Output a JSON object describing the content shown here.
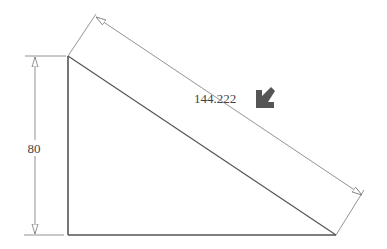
{
  "drawing": {
    "shape": "right-triangle",
    "vertices": {
      "top": [
        68,
        56
      ],
      "bottom_left": [
        68,
        235
      ],
      "bottom_right": [
        336,
        235
      ]
    },
    "colors": {
      "outline": "#555555",
      "dimension": "#777777",
      "text": "#444444",
      "pointer_arrow": "#555555"
    }
  },
  "dimensions": {
    "vertical": {
      "value": "80"
    },
    "hypotenuse": {
      "value": "144.222"
    }
  },
  "annotation": {
    "pointer_icon": "arrow-down-left-icon"
  }
}
